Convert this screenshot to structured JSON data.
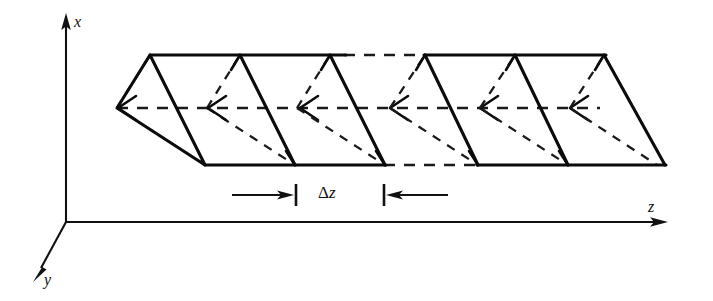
{
  "figure": {
    "type": "3d-line-diagram",
    "canvas": {
      "width": 713,
      "height": 301,
      "background": "#ffffff"
    },
    "ink_color": "#0b0b0b",
    "hidden_line_color": "#1a1a1a"
  },
  "axes": {
    "origin": {
      "x": 66,
      "y": 222
    },
    "items": [
      {
        "name": "x-axis",
        "label": "x",
        "direction": "up",
        "from": {
          "x": 66,
          "y": 222
        },
        "to": {
          "x": 66,
          "y": 17
        },
        "arrow": "at-end",
        "label_pos": {
          "x": 74,
          "y": 14
        }
      },
      {
        "name": "y-axis",
        "label": "y",
        "direction": "down-left",
        "from": {
          "x": 66,
          "y": 222
        },
        "to": {
          "x": 36,
          "y": 277
        },
        "arrow": "at-end",
        "label_pos": {
          "x": 44,
          "y": 272
        }
      },
      {
        "name": "z-axis",
        "label": "z",
        "direction": "right",
        "from": {
          "x": 66,
          "y": 222
        },
        "to": {
          "x": 667,
          "y": 222
        },
        "arrow": "at-end",
        "label_pos": {
          "x": 648,
          "y": 199
        }
      }
    ]
  },
  "structure": {
    "name": "triangular-helix-prism",
    "description": "Repeating triangular cells forming a helical ribbon drawn in oblique projection",
    "top_edge_y": 55,
    "mid_edge_y": 108,
    "bottom_edge_y": 165,
    "front_offset_x": 88,
    "cell_pitch": 90,
    "top_front_x": [
      150,
      240,
      330,
      425,
      515,
      604
    ],
    "bottom_front_x": [
      205,
      295,
      385,
      478,
      568,
      665
    ],
    "back_vertex_x": [
      117,
      207,
      297,
      390,
      480,
      570
    ],
    "top_edge": {
      "solid_from": 150,
      "solid_to": 345,
      "dashed_from": 345,
      "dashed_to": 425,
      "solid2_from": 425,
      "solid2_to": 604
    },
    "bottom_edge": {
      "solid_from": 205,
      "solid_to": 385,
      "dashed_from": 385,
      "dashed_to": 478,
      "solid2_from": 478,
      "solid2_to": 665
    },
    "mid_edge": {
      "dashed_from": 117,
      "dashed_to": 570
    }
  },
  "dimension": {
    "name": "delta-z-dimension",
    "label_delta": "Δ",
    "label_variable": "z",
    "label_full": "Δz",
    "label_pos": {
      "x": 318,
      "y": 184
    },
    "y": 195,
    "left_tick_x": 295,
    "right_tick_x": 385,
    "left_arrow_from_x": 232,
    "right_arrow_from_x": 448,
    "tick_half_height": 11
  }
}
